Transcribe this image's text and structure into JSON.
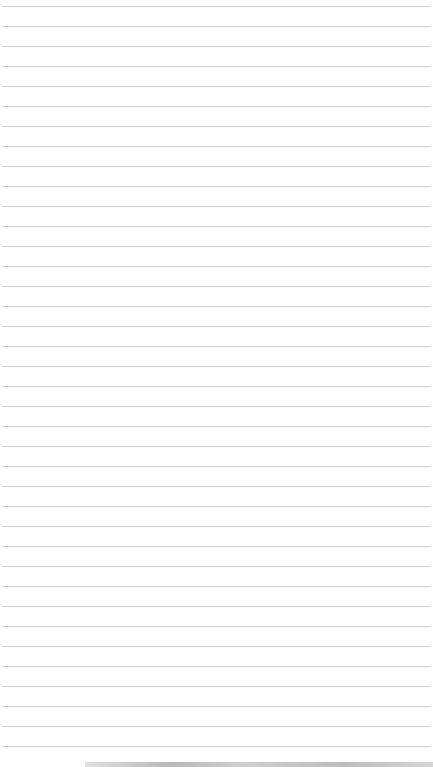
{
  "page": {
    "type": "lined-notepad-paper",
    "line_count": 38,
    "line_color": "#c9c9c9",
    "background_color": "#ffffff",
    "text": ""
  }
}
